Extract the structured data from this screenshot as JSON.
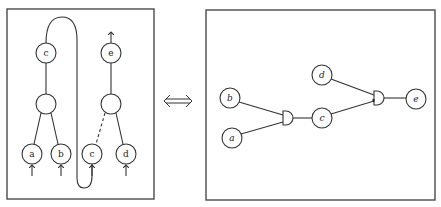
{
  "left_panel": {
    "nodes": [
      {
        "id": "c_top",
        "label": "c",
        "x": 46,
        "y": 53
      },
      {
        "id": "join_left",
        "label": "",
        "x": 46,
        "y": 104
      },
      {
        "id": "e_top",
        "label": "e",
        "x": 111,
        "y": 53
      },
      {
        "id": "join_right",
        "label": "",
        "x": 111,
        "y": 104
      },
      {
        "id": "a",
        "label": "a",
        "x": 32,
        "y": 154
      },
      {
        "id": "b",
        "label": "b",
        "x": 61,
        "y": 154
      },
      {
        "id": "c_bottom",
        "label": "c",
        "x": 92,
        "y": 154
      },
      {
        "id": "d",
        "label": "d",
        "x": 126,
        "y": 154
      }
    ]
  },
  "equivalence_symbol": "⟺",
  "right_panel": {
    "nodes": [
      {
        "id": "b",
        "label": "b",
        "x": 230,
        "y": 98
      },
      {
        "id": "a",
        "label": "a",
        "x": 232,
        "y": 138
      },
      {
        "id": "c",
        "label": "c",
        "x": 322,
        "y": 118
      },
      {
        "id": "d",
        "label": "d",
        "x": 322,
        "y": 75
      },
      {
        "id": "e",
        "label": "e",
        "x": 416,
        "y": 99
      }
    ]
  }
}
